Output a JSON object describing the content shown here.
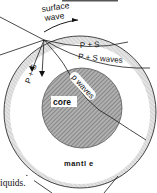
{
  "diagram": {
    "labels": {
      "surface_wave_1": "surface",
      "surface_wave_2": "wave",
      "ps_upper": "P + S",
      "ps_waves": "P + S waves",
      "ps_steep": "P + S",
      "p_waves": "p waves",
      "core": "core",
      "mantle": "mantl e",
      "caption_fragment": "iquids."
    },
    "colors": {
      "line": "#1a1a1a",
      "crust": "#d4d4d4",
      "core": "#9a9a9a",
      "background": "#ffffff"
    }
  }
}
